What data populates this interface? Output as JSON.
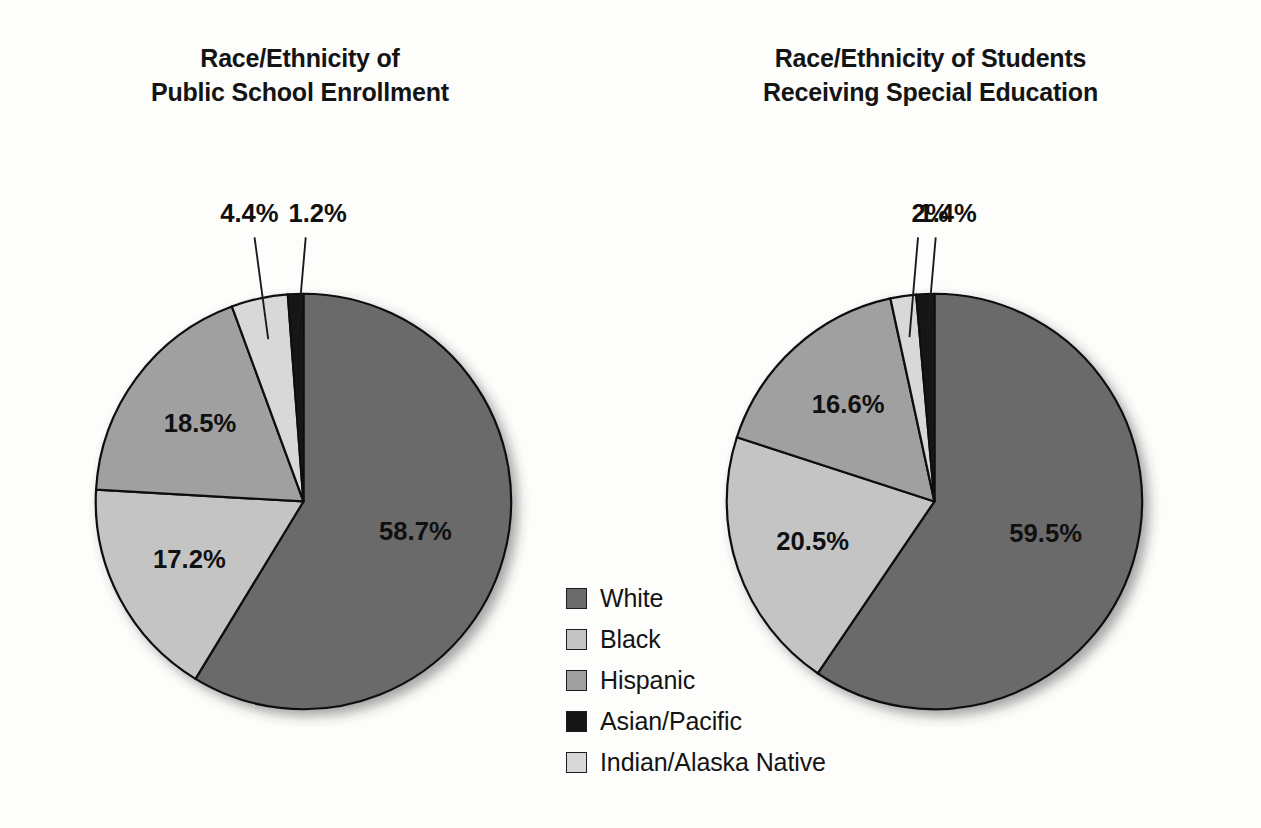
{
  "legend": {
    "items": [
      {
        "label": "White",
        "color": "#6b6b6b",
        "swatch_name": "legend-swatch-white"
      },
      {
        "label": "Black",
        "color": "#c4c4c4",
        "swatch_name": "legend-swatch-black"
      },
      {
        "label": "Hispanic",
        "color": "#a0a0a0",
        "swatch_name": "legend-swatch-hispanic"
      },
      {
        "label": "Asian/Pacific",
        "color": "#161616",
        "swatch_name": "legend-swatch-asian-pacific"
      },
      {
        "label": "Indian/Alaska Native",
        "color": "#d8d8d8",
        "swatch_name": "legend-swatch-indian-alaska-native"
      }
    ]
  },
  "chart_data": [
    {
      "type": "pie",
      "id": "public-school-enrollment",
      "title": "Race/Ethnicity of Public School Enrollment",
      "title_lines": [
        "Race/Ethnicity of",
        "Public School Enrollment"
      ],
      "categories": [
        "White",
        "Black",
        "Hispanic",
        "Indian/Alaska Native",
        "Asian/Pacific"
      ],
      "values": [
        58.7,
        17.2,
        18.5,
        4.4,
        1.2
      ],
      "labels": [
        "58.7%",
        "17.2%",
        "18.5%",
        "4.4%",
        "1.2%"
      ],
      "colors": [
        "#6b6b6b",
        "#c4c4c4",
        "#a0a0a0",
        "#d8d8d8",
        "#161616"
      ],
      "label_placement": [
        "inside",
        "inside",
        "inside",
        "outside",
        "outside"
      ],
      "units": "percent",
      "start_angle_deg": 0,
      "direction": "clockwise",
      "legend_position": "center-between-charts"
    },
    {
      "type": "pie",
      "id": "students-receiving-special-education",
      "title": "Race/Ethnicity of Students Receiving Special Education",
      "title_lines": [
        "Race/Ethnicity of Students",
        "Receiving Special Education"
      ],
      "categories": [
        "White",
        "Black",
        "Hispanic",
        "Indian/Alaska Native",
        "Asian/Pacific"
      ],
      "values": [
        59.5,
        20.5,
        16.6,
        2.0,
        1.4
      ],
      "labels": [
        "59.5%",
        "20.5%",
        "16.6%",
        "2%",
        "1.4%"
      ],
      "colors": [
        "#6b6b6b",
        "#c4c4c4",
        "#a0a0a0",
        "#d8d8d8",
        "#161616"
      ],
      "label_placement": [
        "inside",
        "inside",
        "inside",
        "outside",
        "outside"
      ],
      "units": "percent",
      "start_angle_deg": 0,
      "direction": "clockwise",
      "legend_position": "center-between-charts"
    }
  ]
}
